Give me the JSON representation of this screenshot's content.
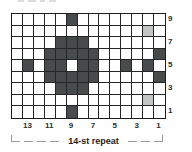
{
  "chart": {
    "columns": 14,
    "rows": 9,
    "repeat_label": "14-st repeat",
    "row_labels_right": [
      "9",
      "7",
      "5",
      "3",
      "1"
    ],
    "row_label_row_indices": [
      0,
      2,
      4,
      6,
      8
    ],
    "col_labels_bottom": [
      "13",
      "11",
      "9",
      "7",
      "5",
      "3",
      "1"
    ],
    "col_label_col_indices": [
      1,
      3,
      5,
      7,
      9,
      11,
      13
    ],
    "cell_value_legend": {
      "0": "white",
      "1": "dark",
      "2": "light-gray"
    },
    "cells": [
      [
        0,
        0,
        0,
        0,
        0,
        1,
        0,
        0,
        0,
        0,
        0,
        0,
        0,
        0
      ],
      [
        0,
        0,
        0,
        0,
        0,
        0,
        0,
        0,
        0,
        0,
        0,
        0,
        2,
        0
      ],
      [
        0,
        0,
        0,
        0,
        1,
        1,
        1,
        0,
        0,
        0,
        0,
        0,
        0,
        0
      ],
      [
        0,
        0,
        0,
        1,
        1,
        1,
        1,
        1,
        0,
        0,
        0,
        0,
        0,
        1
      ],
      [
        0,
        1,
        0,
        1,
        1,
        0,
        1,
        1,
        0,
        0,
        1,
        0,
        1,
        0
      ],
      [
        0,
        0,
        0,
        1,
        1,
        1,
        1,
        1,
        0,
        0,
        0,
        0,
        0,
        1
      ],
      [
        0,
        0,
        0,
        0,
        1,
        1,
        1,
        0,
        0,
        0,
        0,
        0,
        0,
        0
      ],
      [
        0,
        0,
        0,
        0,
        0,
        0,
        0,
        0,
        0,
        0,
        0,
        0,
        2,
        0
      ],
      [
        0,
        0,
        0,
        0,
        0,
        1,
        0,
        0,
        0,
        0,
        0,
        0,
        0,
        0
      ]
    ],
    "colors": {
      "dark_cell": "#474b4b",
      "light_cell": "#c3c6c5",
      "grid_line": "#262626",
      "background": "#ffffff",
      "bracket": "#9b9b9b",
      "label_text": "#2d2d2d"
    }
  }
}
